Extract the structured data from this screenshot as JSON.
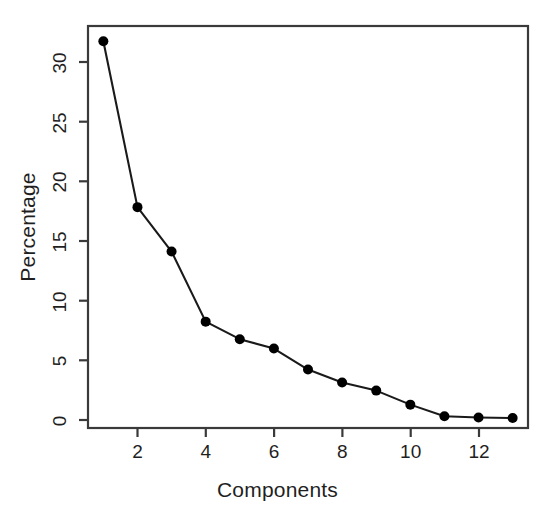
{
  "chart": {
    "title": "",
    "xlabel": "Components",
    "ylabel": "Percentage",
    "y_ticks": [
      "0",
      "5",
      "10",
      "15",
      "20",
      "25",
      "30"
    ],
    "x_ticks": [
      "2",
      "4",
      "6",
      "8",
      "10",
      "12"
    ],
    "line_color": "#1a1a1a",
    "point_color": "#000000",
    "axis_color": "#3a3a3a",
    "background_color": "#ffffff"
  },
  "chart_data": {
    "type": "line",
    "title": "",
    "xlabel": "Components",
    "ylabel": "Percentage",
    "x": [
      1,
      2,
      3,
      4,
      5,
      6,
      7,
      8,
      9,
      10,
      11,
      12,
      13
    ],
    "values": [
      32.5,
      18.3,
      14.5,
      8.5,
      7.0,
      6.2,
      4.4,
      3.3,
      2.6,
      1.4,
      0.4,
      0.3,
      0.25
    ],
    "series": [
      {
        "name": "Percentage of variance explained",
        "values": [
          32.5,
          18.3,
          14.5,
          8.5,
          7.0,
          6.2,
          4.4,
          3.3,
          2.6,
          1.4,
          0.4,
          0.3,
          0.25
        ]
      }
    ],
    "xlim": [
      0.55,
      13.45
    ],
    "ylim": [
      -0.6,
      33.8
    ],
    "x_tick_values": [
      2,
      4,
      6,
      8,
      10,
      12
    ],
    "y_tick_values": [
      0,
      5,
      10,
      15,
      20,
      25,
      30
    ],
    "x_tick_labels": [
      "2",
      "4",
      "6",
      "8",
      "10",
      "12"
    ],
    "y_tick_labels": [
      "0",
      "5",
      "10",
      "15",
      "20",
      "25",
      "30"
    ],
    "grid": false,
    "legend": null,
    "markers": "filled-circle",
    "annotations": []
  }
}
